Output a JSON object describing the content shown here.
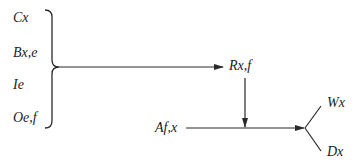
{
  "diagram": {
    "inputs": [
      {
        "id": "cx",
        "label": "Cx"
      },
      {
        "id": "bxe",
        "label": "Bx,e"
      },
      {
        "id": "ie",
        "label": "Ie"
      },
      {
        "id": "oef",
        "label": "Oe,f"
      }
    ],
    "intermediate": {
      "label": "Rx,f"
    },
    "side_input": {
      "label": "Af,x"
    },
    "outputs": [
      {
        "id": "wx",
        "label": "Wx"
      },
      {
        "id": "dx",
        "label": "Dx"
      }
    ],
    "colors": {
      "line": "#2a2a2a",
      "text": "#222222",
      "background": "#ffffff"
    }
  }
}
